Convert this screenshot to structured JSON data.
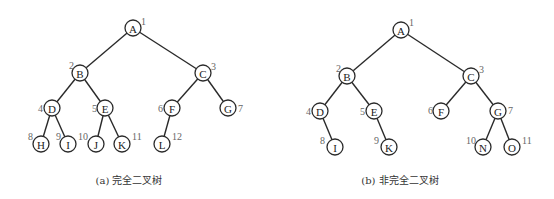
{
  "figures": [
    {
      "id": "a",
      "caption": "(a) 完全二叉树",
      "caption_pos": {
        "x": 129,
        "y": 172
      },
      "node_radius": 8,
      "nodes": [
        {
          "label": "A",
          "index": "1",
          "x": 133,
          "y": 28,
          "ix": 141,
          "iy": 21
        },
        {
          "label": "B",
          "index": "2",
          "x": 80,
          "y": 73,
          "ix": 69,
          "iy": 65
        },
        {
          "label": "C",
          "index": "3",
          "x": 203,
          "y": 73,
          "ix": 211,
          "iy": 66
        },
        {
          "label": "D",
          "index": "4",
          "x": 52,
          "y": 108,
          "ix": 38,
          "iy": 108
        },
        {
          "label": "E",
          "index": "5",
          "x": 105,
          "y": 108,
          "ix": 92,
          "iy": 108
        },
        {
          "label": "F",
          "index": "6",
          "x": 172,
          "y": 108,
          "ix": 158,
          "iy": 108
        },
        {
          "label": "G",
          "index": "7",
          "x": 228,
          "y": 108,
          "ix": 238,
          "iy": 108
        },
        {
          "label": "H",
          "index": "8",
          "x": 41,
          "y": 144,
          "ix": 28,
          "iy": 136
        },
        {
          "label": "I",
          "index": "9",
          "x": 68,
          "y": 144,
          "ix": 56,
          "iy": 136
        },
        {
          "label": "J",
          "index": "10",
          "x": 96,
          "y": 144,
          "ix": 78,
          "iy": 136
        },
        {
          "label": "K",
          "index": "11",
          "x": 122,
          "y": 144,
          "ix": 132,
          "iy": 136
        },
        {
          "label": "L",
          "index": "12",
          "x": 162,
          "y": 144,
          "ix": 172,
          "iy": 136
        }
      ],
      "edges": [
        [
          "A",
          "B"
        ],
        [
          "A",
          "C"
        ],
        [
          "B",
          "D"
        ],
        [
          "B",
          "E"
        ],
        [
          "C",
          "F"
        ],
        [
          "C",
          "G"
        ],
        [
          "D",
          "H"
        ],
        [
          "D",
          "I"
        ],
        [
          "E",
          "J"
        ],
        [
          "E",
          "K"
        ],
        [
          "F",
          "L"
        ]
      ]
    },
    {
      "id": "b",
      "caption": "(b) 非完全二叉树",
      "caption_pos": {
        "x": 400,
        "y": 172
      },
      "node_radius": 8,
      "nodes": [
        {
          "label": "A",
          "index": "1",
          "x": 401,
          "y": 30,
          "ix": 409,
          "iy": 22
        },
        {
          "label": "B",
          "index": "2",
          "x": 347,
          "y": 76,
          "ix": 336,
          "iy": 68
        },
        {
          "label": "C",
          "index": "3",
          "x": 471,
          "y": 76,
          "ix": 479,
          "iy": 69
        },
        {
          "label": "D",
          "index": "4",
          "x": 320,
          "y": 111,
          "ix": 306,
          "iy": 111
        },
        {
          "label": "E",
          "index": "5",
          "x": 374,
          "y": 111,
          "ix": 360,
          "iy": 111
        },
        {
          "label": "F",
          "index": "6",
          "x": 441,
          "y": 111,
          "ix": 428,
          "iy": 110
        },
        {
          "label": "G",
          "index": "7",
          "x": 498,
          "y": 111,
          "ix": 508,
          "iy": 110
        },
        {
          "label": "I",
          "index": "8",
          "x": 335,
          "y": 147,
          "ix": 320,
          "iy": 140
        },
        {
          "label": "K",
          "index": "9",
          "x": 389,
          "y": 147,
          "ix": 374,
          "iy": 140
        },
        {
          "label": "N",
          "index": "10",
          "x": 483,
          "y": 147,
          "ix": 466,
          "iy": 140
        },
        {
          "label": "O",
          "index": "11",
          "x": 512,
          "y": 147,
          "ix": 522,
          "iy": 140
        }
      ],
      "edges": [
        [
          "A",
          "B"
        ],
        [
          "A",
          "C"
        ],
        [
          "B",
          "D"
        ],
        [
          "B",
          "E"
        ],
        [
          "C",
          "F"
        ],
        [
          "C",
          "G"
        ],
        [
          "D",
          "I"
        ],
        [
          "E",
          "K"
        ],
        [
          "G",
          "N"
        ],
        [
          "G",
          "O"
        ]
      ]
    }
  ]
}
